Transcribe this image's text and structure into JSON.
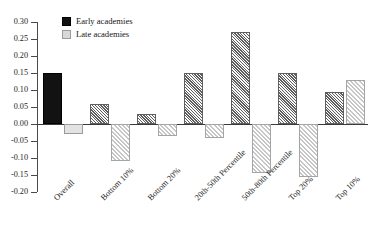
{
  "chart_data": {
    "type": "bar",
    "title": "",
    "xlabel": "",
    "ylabel": "",
    "ylim": [
      -0.2,
      0.3
    ],
    "ytick_step": 0.05,
    "grid": false,
    "legend_position": "top-left",
    "categories": [
      "Overall",
      "Bottom 10%",
      "Bottom 20%",
      "20th-50th Percentile",
      "50th-80th Percentile",
      "Top 20%",
      "Top 10%"
    ],
    "ytick_labels": [
      "0.30",
      "0.25",
      "0.20",
      "0.15",
      "0.10",
      "0.05",
      "0.00",
      "-0.05",
      "-0.10",
      "-0.15",
      "-0.20"
    ],
    "ytick_values": [
      0.3,
      0.25,
      0.2,
      0.15,
      0.1,
      0.05,
      0.0,
      -0.05,
      -0.1,
      -0.15,
      -0.2
    ],
    "series": [
      {
        "name": "Early academies",
        "values": [
          0.15,
          0.06,
          0.03,
          0.15,
          0.27,
          0.15,
          0.095
        ]
      },
      {
        "name": "Late academies",
        "values": [
          -0.03,
          -0.11,
          -0.035,
          -0.04,
          -0.145,
          -0.155,
          0.13
        ]
      }
    ]
  },
  "legend": {
    "items": [
      {
        "label": "Early academies",
        "swatch": "dark-square-icon"
      },
      {
        "label": "Late academies",
        "swatch": "light-square-icon"
      }
    ]
  }
}
